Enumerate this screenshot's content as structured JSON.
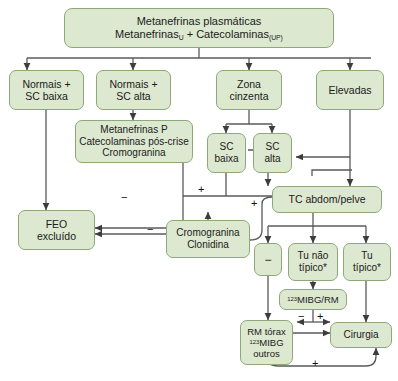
{
  "diagram": {
    "title_node": {
      "line1": "Metanefrinas plasmáticas",
      "line2_a": "Metanefrinas",
      "line2_sub_a": "U",
      "line2_mid": " + Catecolaminas",
      "line2_sub_b": "(UP)"
    },
    "nodes": {
      "normais_sc_baixa": {
        "l1": "Normais +",
        "l2": "SC baixa"
      },
      "normais_sc_alta": {
        "l1": "Normais +",
        "l2": "SC alta"
      },
      "zona_cinzenta": {
        "l1": "Zona",
        "l2": "cinzenta"
      },
      "elevadas": {
        "l1": "Elevadas"
      },
      "metanefrinas_p": {
        "l1": "Metanefrinas P",
        "l2": "Catecolaminas pós-crise",
        "l3": "Cromogranina"
      },
      "sc_baixa": {
        "l1": "SC",
        "l2": "baixa"
      },
      "sc_alta": {
        "l1": "SC",
        "l2": "alta"
      },
      "tc_abdom": {
        "l1": "TC abdom/pelve"
      },
      "feo_excluido": {
        "l1": "FEO",
        "l2": "excluído"
      },
      "cromogranina_clonidina": {
        "l1": "Cromogranina",
        "l2": "Clonidina"
      },
      "tu_nao_tipico": {
        "l1": "Tu não",
        "l2": "típico*"
      },
      "tu_tipico": {
        "l1": "Tu",
        "l2": "típico*"
      },
      "mibg_rm": {
        "sup": "123",
        "l1": "MIBG/RM"
      },
      "rm_torax": {
        "l1": "RM tórax",
        "sup": "123",
        "l2": "MIBG",
        "l3": "outros"
      },
      "cirurgia": {
        "l1": "Cirurgia"
      },
      "minus_box": {
        "l1": "−"
      }
    },
    "edge_labels": {
      "plus_to_tc_from_zona": "+",
      "minus_metanefrinas_to_feo": "−",
      "minus_cromogranina_to_feo": "−",
      "plus_cromogranina_to_tc": "+",
      "minus_rm_torax": "−",
      "plus_rm_torax": "+",
      "plus_feedback_cirurgia": "+"
    },
    "colors": {
      "node_fill": "#dde8d0",
      "node_border": "#8fa878",
      "edge": "#4d4d4d",
      "text": "#1b1b1b",
      "background": "#ffffff"
    }
  }
}
